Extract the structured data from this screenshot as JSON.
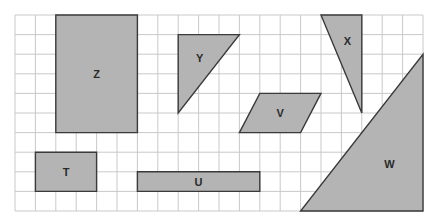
{
  "grid": {
    "origin_x": 15,
    "origin_y": 15,
    "cell_w": 20.4,
    "cell_h": 19.6,
    "cols": 20,
    "rows": 10,
    "line_color": "#c9c9c9"
  },
  "style": {
    "shape_fill": "#b4b4b4",
    "shape_stroke": "#3a3a3a",
    "label_color": "#2a2a2a"
  },
  "shapes": [
    {
      "id": "Z",
      "label": "Z",
      "type": "rectangle",
      "points": [
        [
          2,
          0
        ],
        [
          6,
          0
        ],
        [
          6,
          6
        ],
        [
          2,
          6
        ]
      ],
      "label_at": [
        4,
        3
      ]
    },
    {
      "id": "Y",
      "label": "Y",
      "type": "triangle",
      "points": [
        [
          8,
          1
        ],
        [
          11,
          1
        ],
        [
          8,
          5
        ]
      ],
      "label_at": [
        9.05,
        2.2
      ]
    },
    {
      "id": "X",
      "label": "X",
      "type": "triangle",
      "points": [
        [
          15,
          0
        ],
        [
          17,
          0
        ],
        [
          17,
          5
        ]
      ],
      "label_at": [
        16.3,
        1.35
      ]
    },
    {
      "id": "V",
      "label": "V",
      "type": "parallelogram",
      "points": [
        [
          12,
          4
        ],
        [
          15,
          4
        ],
        [
          14,
          6
        ],
        [
          11,
          6
        ]
      ],
      "label_at": [
        13,
        5
      ]
    },
    {
      "id": "T",
      "label": "T",
      "type": "rectangle",
      "points": [
        [
          1,
          7
        ],
        [
          4,
          7
        ],
        [
          4,
          9
        ],
        [
          1,
          9
        ]
      ],
      "label_at": [
        2.5,
        8
      ]
    },
    {
      "id": "U",
      "label": "U",
      "type": "rectangle",
      "points": [
        [
          6,
          8
        ],
        [
          12,
          8
        ],
        [
          12,
          9
        ],
        [
          6,
          9
        ]
      ],
      "label_at": [
        9,
        8.5
      ]
    },
    {
      "id": "W",
      "label": "W",
      "type": "triangle",
      "points": [
        [
          20,
          2
        ],
        [
          20,
          10
        ],
        [
          14,
          10
        ]
      ],
      "label_at": [
        18.35,
        7.6
      ]
    }
  ]
}
